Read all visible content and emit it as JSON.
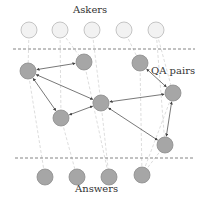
{
  "labels": {
    "askers": "Askers",
    "qa_pairs": "QA pairs",
    "answers": "Answers"
  },
  "colors": {
    "asker_fill": "#f2f2f2",
    "asker_stroke": "#b8b8b8",
    "node_fill": "#a6a6a6",
    "node_stroke": "#8c8c8c",
    "edge": "#555555",
    "dashed_light": "#cfcfcf",
    "separator": "#666666"
  },
  "askers": [
    {
      "x": 29,
      "y": 30
    },
    {
      "x": 60,
      "y": 30
    },
    {
      "x": 92,
      "y": 30
    },
    {
      "x": 124,
      "y": 30
    },
    {
      "x": 156,
      "y": 30
    }
  ],
  "qa_pairs": [
    {
      "id": "A",
      "x": 28,
      "y": 71
    },
    {
      "id": "B",
      "x": 84,
      "y": 62
    },
    {
      "id": "C",
      "x": 101,
      "y": 103
    },
    {
      "id": "D",
      "x": 61,
      "y": 118
    },
    {
      "id": "E",
      "x": 140,
      "y": 63
    },
    {
      "id": "F",
      "x": 173,
      "y": 93
    },
    {
      "id": "G",
      "x": 165,
      "y": 145
    }
  ],
  "answers": [
    {
      "x": 45,
      "y": 177
    },
    {
      "x": 77,
      "y": 177
    },
    {
      "x": 109,
      "y": 177
    },
    {
      "x": 142,
      "y": 175
    }
  ],
  "edges": [
    [
      "A",
      "B"
    ],
    [
      "A",
      "C"
    ],
    [
      "A",
      "D"
    ],
    [
      "D",
      "C"
    ],
    [
      "C",
      "F"
    ],
    [
      "E",
      "F"
    ],
    [
      "F",
      "G"
    ],
    [
      "C",
      "G"
    ]
  ]
}
